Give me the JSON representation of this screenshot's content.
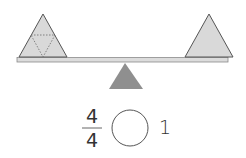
{
  "diagram": {
    "left_pan": {
      "shape": "triangle",
      "subdivided": true,
      "dotted_inner_triangle": true
    },
    "right_pan": {
      "shape": "triangle",
      "subdivided": false
    },
    "colors": {
      "shape_fill": "#d9d9d9",
      "stroke": "#555555",
      "fulcrum": "#8f8f8f",
      "beam": "#dcdcdc"
    }
  },
  "comparison": {
    "fraction": {
      "numerator": "4",
      "denominator": "4"
    },
    "answer_circle": "",
    "right_value": "1"
  }
}
